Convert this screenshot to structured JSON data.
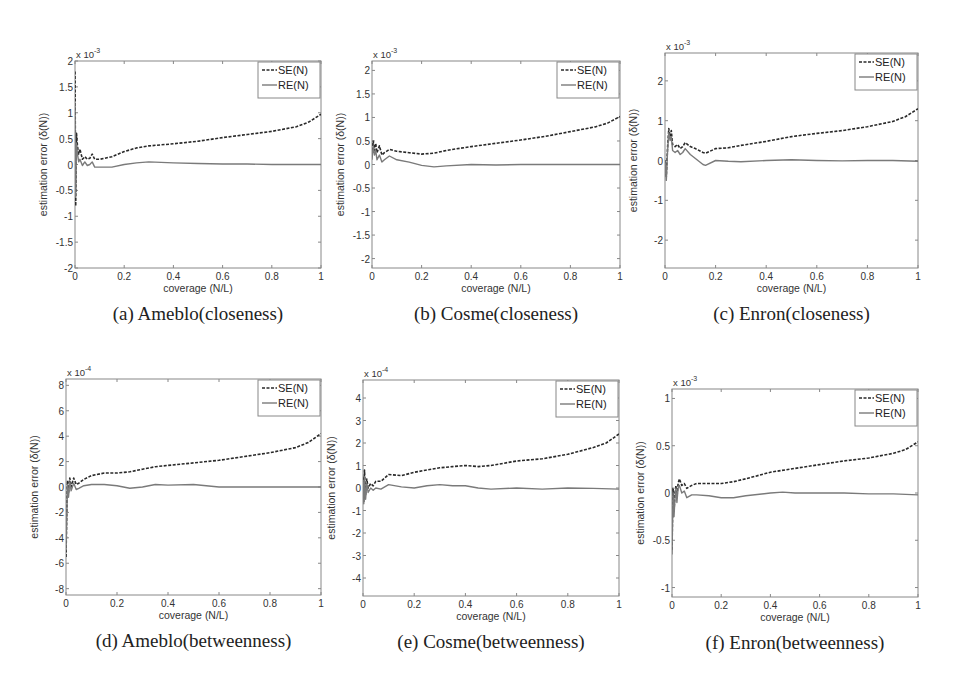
{
  "figure": {
    "colors": {
      "se": "#2a2a2a",
      "re": "#7a7a7a",
      "axis": "#888888",
      "text": "#333333"
    }
  },
  "chart_data": [
    {
      "id": "a",
      "type": "line",
      "caption": "(a)  Ameblo(closeness)",
      "xlabel": "coverage (N/L)",
      "ylabel": "estimation error (δ(N))",
      "multiplier": "x 10",
      "exponent": "-3",
      "xlim": [
        0,
        1
      ],
      "ylim": [
        -2,
        2
      ],
      "xticks": [
        0,
        0.2,
        0.4,
        0.6,
        0.8,
        1
      ],
      "yticks": [
        -2,
        -1.5,
        -1,
        -0.5,
        0,
        0.5,
        1,
        1.5,
        2
      ],
      "legend": [
        "SE(N)",
        "RE(N)"
      ],
      "legend_position": "upper right",
      "box": [
        75,
        61,
        321,
        268
      ],
      "series": [
        {
          "name": "SE(N)",
          "style": "dashed",
          "x": [
            0,
            0.003,
            0.006,
            0.01,
            0.015,
            0.02,
            0.03,
            0.04,
            0.05,
            0.06,
            0.07,
            0.08,
            0.1,
            0.15,
            0.2,
            0.25,
            0.3,
            0.4,
            0.5,
            0.6,
            0.7,
            0.8,
            0.9,
            0.95,
            1.0
          ],
          "values": [
            1.8,
            -0.8,
            0.6,
            0.35,
            0.2,
            0.3,
            0.1,
            0.15,
            0.1,
            0.12,
            0.2,
            0.1,
            0.1,
            0.15,
            0.25,
            0.32,
            0.36,
            0.4,
            0.45,
            0.52,
            0.58,
            0.64,
            0.73,
            0.82,
            0.97
          ]
        },
        {
          "name": "RE(N)",
          "style": "solid",
          "x": [
            0,
            0.003,
            0.006,
            0.01,
            0.015,
            0.02,
            0.03,
            0.04,
            0.05,
            0.06,
            0.07,
            0.08,
            0.1,
            0.15,
            0.2,
            0.25,
            0.3,
            0.4,
            0.5,
            0.6,
            0.7,
            0.8,
            0.9,
            1.0
          ],
          "values": [
            1.2,
            -0.6,
            0.4,
            0.2,
            0.05,
            0.1,
            -0.02,
            0.05,
            -0.02,
            0.0,
            0.05,
            -0.05,
            -0.05,
            -0.05,
            0.0,
            0.03,
            0.05,
            0.03,
            0.02,
            0.01,
            0.01,
            0.0,
            0.0,
            0.0
          ]
        }
      ]
    },
    {
      "id": "b",
      "type": "line",
      "caption": "(b)  Cosme(closeness)",
      "xlabel": "coverage (N/L)",
      "ylabel": "estimation error (δ(N))",
      "multiplier": "x 10",
      "exponent": "-3",
      "xlim": [
        0,
        1
      ],
      "ylim": [
        -2.2,
        2.2
      ],
      "xticks": [
        0,
        0.2,
        0.4,
        0.6,
        0.8,
        1
      ],
      "yticks": [
        -2,
        -1.5,
        -1,
        -0.5,
        0,
        0.5,
        1,
        1.5,
        2
      ],
      "legend": [
        "SE(N)",
        "RE(N)"
      ],
      "legend_position": "upper right",
      "box": [
        372,
        61,
        620,
        268
      ],
      "series": [
        {
          "name": "SE(N)",
          "style": "dashed",
          "x": [
            0,
            0.005,
            0.01,
            0.015,
            0.02,
            0.03,
            0.04,
            0.05,
            0.07,
            0.1,
            0.15,
            0.2,
            0.25,
            0.3,
            0.4,
            0.5,
            0.6,
            0.7,
            0.8,
            0.9,
            0.95,
            1.0
          ],
          "values": [
            0.2,
            0.5,
            0.3,
            0.45,
            0.25,
            0.4,
            0.2,
            0.25,
            0.32,
            0.28,
            0.25,
            0.22,
            0.24,
            0.3,
            0.38,
            0.45,
            0.52,
            0.6,
            0.7,
            0.8,
            0.88,
            1.02
          ]
        },
        {
          "name": "RE(N)",
          "style": "solid",
          "x": [
            0,
            0.005,
            0.01,
            0.015,
            0.02,
            0.03,
            0.04,
            0.05,
            0.07,
            0.1,
            0.15,
            0.2,
            0.25,
            0.3,
            0.4,
            0.5,
            0.6,
            0.7,
            0.8,
            0.9,
            1.0
          ],
          "values": [
            0.1,
            0.4,
            0.2,
            0.3,
            0.1,
            0.2,
            0.05,
            0.1,
            0.18,
            0.1,
            0.05,
            -0.02,
            -0.05,
            -0.03,
            0.0,
            -0.01,
            0.0,
            0.0,
            0.0,
            0.0,
            0.0
          ]
        }
      ]
    },
    {
      "id": "c",
      "type": "line",
      "caption": "(c)  Enron(closeness)",
      "xlabel": "coverage (N/L)",
      "ylabel": "estimation error (δ(N))",
      "multiplier": "x 10",
      "exponent": "-3",
      "xlim": [
        0,
        1
      ],
      "ylim": [
        -2.7,
        2.7
      ],
      "xticks": [
        0,
        0.2,
        0.4,
        0.6,
        0.8,
        1
      ],
      "yticks": [
        -2,
        -1,
        0,
        1,
        2
      ],
      "legend": [
        "SE(N)",
        "RE(N)"
      ],
      "legend_position": "upper right",
      "box": [
        665,
        53,
        918,
        268
      ],
      "series": [
        {
          "name": "SE(N)",
          "style": "dashed",
          "x": [
            0,
            0.005,
            0.01,
            0.015,
            0.02,
            0.025,
            0.03,
            0.04,
            0.05,
            0.06,
            0.07,
            0.08,
            0.1,
            0.12,
            0.15,
            0.16,
            0.2,
            0.25,
            0.3,
            0.4,
            0.5,
            0.6,
            0.7,
            0.8,
            0.9,
            0.95,
            1.0
          ],
          "values": [
            0,
            -0.4,
            0.3,
            0.8,
            0.6,
            0.75,
            0.4,
            0.35,
            0.4,
            0.3,
            0.35,
            0.45,
            0.35,
            0.3,
            0.2,
            0.18,
            0.3,
            0.32,
            0.38,
            0.48,
            0.6,
            0.68,
            0.75,
            0.85,
            0.98,
            1.1,
            1.3
          ]
        },
        {
          "name": "RE(N)",
          "style": "solid",
          "x": [
            0,
            0.005,
            0.01,
            0.015,
            0.02,
            0.025,
            0.03,
            0.04,
            0.05,
            0.06,
            0.07,
            0.08,
            0.1,
            0.12,
            0.15,
            0.16,
            0.2,
            0.25,
            0.3,
            0.4,
            0.5,
            0.6,
            0.7,
            0.8,
            0.9,
            1.0
          ],
          "values": [
            0,
            -0.5,
            0.2,
            0.7,
            0.5,
            0.6,
            0.25,
            0.2,
            0.25,
            0.15,
            0.2,
            0.3,
            0.15,
            0.05,
            -0.1,
            -0.12,
            0.0,
            -0.02,
            -0.03,
            0.0,
            0.02,
            0.0,
            -0.01,
            0.0,
            0.0,
            -0.02
          ]
        }
      ]
    },
    {
      "id": "d",
      "type": "line",
      "caption": "(d)  Ameblo(betweenness)",
      "xlabel": "coverage (N/L)",
      "ylabel": "estimation error (δ(N))",
      "multiplier": "x 10",
      "exponent": "-4",
      "xlim": [
        0,
        1
      ],
      "ylim": [
        -8.5,
        8.5
      ],
      "xticks": [
        0,
        0.2,
        0.4,
        0.6,
        0.8,
        1
      ],
      "yticks": [
        -8,
        -6,
        -4,
        -2,
        0,
        2,
        4,
        6,
        8
      ],
      "legend": [
        "SE(N)",
        "RE(N)"
      ],
      "legend_position": "upper right",
      "box": [
        66,
        379,
        321,
        595
      ],
      "series": [
        {
          "name": "SE(N)",
          "style": "dashed",
          "x": [
            0,
            0.003,
            0.006,
            0.01,
            0.015,
            0.02,
            0.03,
            0.04,
            0.05,
            0.07,
            0.1,
            0.15,
            0.2,
            0.25,
            0.3,
            0.35,
            0.4,
            0.5,
            0.6,
            0.7,
            0.8,
            0.9,
            0.95,
            1.0
          ],
          "values": [
            -5.5,
            -2,
            0.5,
            -0.5,
            0.7,
            0,
            0.7,
            0.2,
            0.3,
            0.6,
            0.9,
            1.1,
            1.1,
            1.2,
            1.4,
            1.6,
            1.7,
            1.9,
            2.1,
            2.4,
            2.7,
            3.1,
            3.5,
            4.2
          ]
        },
        {
          "name": "RE(N)",
          "style": "solid",
          "x": [
            0,
            0.003,
            0.006,
            0.01,
            0.015,
            0.02,
            0.03,
            0.04,
            0.05,
            0.07,
            0.1,
            0.15,
            0.2,
            0.25,
            0.3,
            0.35,
            0.4,
            0.5,
            0.6,
            0.7,
            0.8,
            0.9,
            1.0
          ],
          "values": [
            -5,
            -2.2,
            0.2,
            -0.8,
            0.4,
            -0.3,
            0.3,
            -0.2,
            -0.1,
            0.1,
            0.2,
            0.2,
            0.1,
            -0.1,
            0.0,
            0.2,
            0.15,
            0.2,
            0.0,
            0.0,
            0.0,
            0.0,
            0.0
          ]
        }
      ]
    },
    {
      "id": "e",
      "type": "line",
      "caption": "(e)  Cosme(betweenness)",
      "xlabel": "coverage (N/L)",
      "ylabel": "estimation error (δ(N))",
      "multiplier": "x 10",
      "exponent": "-4",
      "xlim": [
        0,
        1
      ],
      "ylim": [
        -4.8,
        4.8
      ],
      "xticks": [
        0,
        0.2,
        0.4,
        0.6,
        0.8,
        1
      ],
      "yticks": [
        -4,
        -3,
        -2,
        -1,
        0,
        1,
        2,
        3,
        4
      ],
      "legend": [
        "SE(N)",
        "RE(N)"
      ],
      "legend_position": "upper right",
      "box": [
        363,
        380,
        619,
        596
      ],
      "series": [
        {
          "name": "SE(N)",
          "style": "dashed",
          "x": [
            0,
            0.003,
            0.006,
            0.01,
            0.015,
            0.02,
            0.03,
            0.04,
            0.05,
            0.07,
            0.1,
            0.15,
            0.2,
            0.25,
            0.3,
            0.35,
            0.4,
            0.45,
            0.5,
            0.6,
            0.7,
            0.8,
            0.9,
            0.95,
            1.0
          ],
          "values": [
            0.5,
            -0.6,
            0.8,
            -0.3,
            0.4,
            0.0,
            0.2,
            0.1,
            0.3,
            0.3,
            0.6,
            0.55,
            0.7,
            0.8,
            0.9,
            0.95,
            1.0,
            0.95,
            1.0,
            1.2,
            1.3,
            1.5,
            1.8,
            2.0,
            2.4
          ]
        },
        {
          "name": "RE(N)",
          "style": "solid",
          "x": [
            0,
            0.003,
            0.006,
            0.01,
            0.015,
            0.02,
            0.03,
            0.04,
            0.05,
            0.07,
            0.1,
            0.15,
            0.2,
            0.25,
            0.3,
            0.35,
            0.4,
            0.45,
            0.5,
            0.6,
            0.7,
            0.8,
            0.9,
            1.0
          ],
          "values": [
            0.3,
            -0.7,
            0.5,
            -0.5,
            0.2,
            -0.2,
            0.0,
            -0.1,
            0.0,
            -0.05,
            0.15,
            0.05,
            0.0,
            0.1,
            0.15,
            0.1,
            0.1,
            0.0,
            -0.05,
            0.0,
            -0.05,
            0.0,
            -0.02,
            -0.05
          ]
        }
      ]
    },
    {
      "id": "f",
      "type": "line",
      "caption": "(f)  Enron(betweenness)",
      "xlabel": "coverage (N/L)",
      "ylabel": "estimation error (δ(N))",
      "multiplier": "x 10",
      "exponent": "-3",
      "xlim": [
        0,
        1
      ],
      "ylim": [
        -1.1,
        1.1
      ],
      "xticks": [
        0,
        0.2,
        0.4,
        0.6,
        0.8,
        1
      ],
      "yticks": [
        -1,
        -0.5,
        0,
        0.5,
        1
      ],
      "legend": [
        "SE(N)",
        "RE(N)"
      ],
      "legend_position": "upper right",
      "box": [
        672,
        389,
        918,
        597
      ],
      "series": [
        {
          "name": "SE(N)",
          "style": "dashed",
          "x": [
            0,
            0.004,
            0.008,
            0.012,
            0.016,
            0.02,
            0.025,
            0.03,
            0.04,
            0.05,
            0.06,
            0.08,
            0.1,
            0.15,
            0.2,
            0.25,
            0.3,
            0.4,
            0.5,
            0.6,
            0.7,
            0.8,
            0.9,
            0.95,
            1.0
          ],
          "values": [
            -0.6,
            0.05,
            -0.2,
            0.0,
            0.08,
            -0.05,
            0.1,
            0.15,
            0.08,
            0.1,
            0.05,
            0.08,
            0.1,
            0.1,
            0.1,
            0.12,
            0.15,
            0.22,
            0.26,
            0.3,
            0.34,
            0.37,
            0.42,
            0.46,
            0.54
          ]
        },
        {
          "name": "RE(N)",
          "style": "solid",
          "x": [
            0,
            0.004,
            0.008,
            0.012,
            0.016,
            0.02,
            0.025,
            0.03,
            0.04,
            0.05,
            0.06,
            0.08,
            0.1,
            0.15,
            0.2,
            0.25,
            0.3,
            0.4,
            0.45,
            0.5,
            0.6,
            0.7,
            0.8,
            0.9,
            1.0
          ],
          "values": [
            -0.65,
            0.0,
            -0.25,
            -0.05,
            0.05,
            -0.1,
            0.05,
            0.08,
            0.0,
            0.02,
            -0.05,
            -0.02,
            -0.02,
            -0.03,
            -0.05,
            -0.05,
            -0.03,
            0.0,
            0.01,
            0.0,
            0.0,
            0.0,
            -0.01,
            -0.01,
            -0.02
          ]
        }
      ]
    }
  ]
}
